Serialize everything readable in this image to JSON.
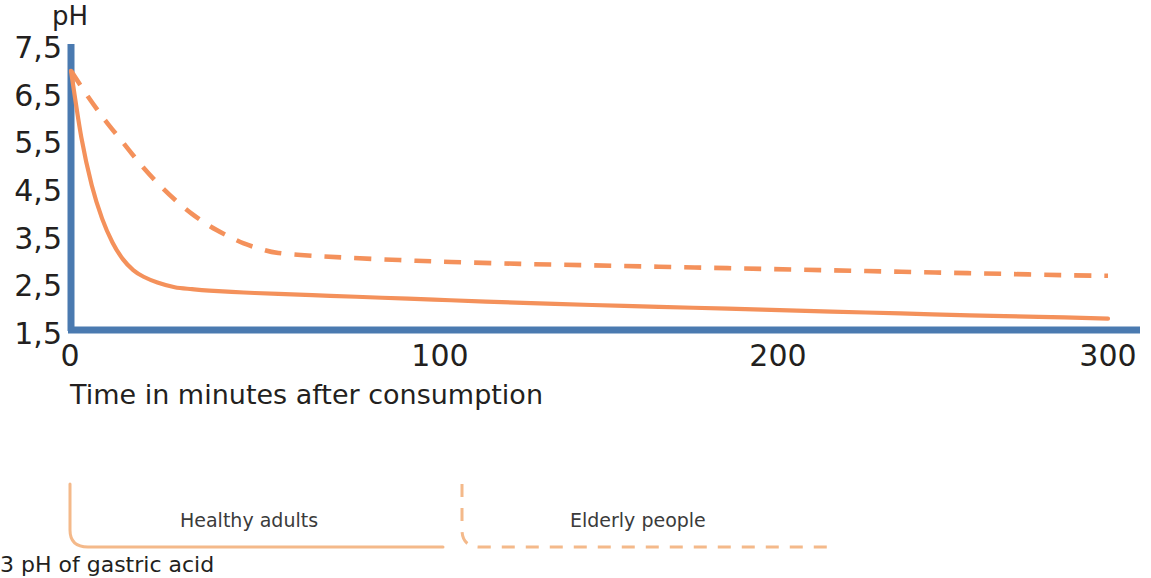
{
  "chart_data": {
    "type": "line",
    "title": "",
    "subtitle": "",
    "xlabel": "Time in minutes after consumption",
    "ylabel": "pH",
    "xlim": [
      0,
      300
    ],
    "ylim": [
      1.5,
      7.5
    ],
    "xticks": [
      0,
      100,
      200,
      300
    ],
    "xticklabels": [
      "0",
      "100",
      "200",
      "300"
    ],
    "yticks": [
      1.5,
      2.5,
      3.5,
      4.5,
      5.5,
      6.5,
      7.5
    ],
    "yticklabels": [
      "1,5",
      "2,5",
      "3,5",
      "4,5",
      "5,5",
      "6,5",
      "7,5"
    ],
    "grid": false,
    "legend_position": "below",
    "axis_color": "#4a7ab0",
    "series": [
      {
        "name": "Healthy adults",
        "style": "solid",
        "color": "#f4915b",
        "x": [
          0,
          3,
          6,
          9,
          12,
          15,
          18,
          21,
          25,
          30,
          35,
          40,
          50,
          60,
          75,
          90,
          105,
          120,
          140,
          160,
          180,
          200,
          220,
          240,
          260,
          280,
          300
        ],
        "y": [
          7.0,
          5.6,
          4.6,
          3.9,
          3.4,
          3.05,
          2.82,
          2.68,
          2.56,
          2.46,
          2.42,
          2.39,
          2.35,
          2.32,
          2.28,
          2.24,
          2.2,
          2.16,
          2.11,
          2.07,
          2.03,
          1.99,
          1.95,
          1.91,
          1.87,
          1.84,
          1.8
        ]
      },
      {
        "name": "Elderly people",
        "style": "dashed",
        "color": "#f4915b",
        "x": [
          0,
          5,
          10,
          15,
          20,
          25,
          30,
          35,
          40,
          45,
          50,
          55,
          60,
          70,
          80,
          95,
          110,
          130,
          150,
          170,
          190,
          210,
          230,
          250,
          270,
          290,
          300
        ],
        "y": [
          7.0,
          6.45,
          5.95,
          5.5,
          5.05,
          4.65,
          4.3,
          4.0,
          3.75,
          3.55,
          3.38,
          3.26,
          3.18,
          3.12,
          3.08,
          3.03,
          2.99,
          2.95,
          2.92,
          2.89,
          2.86,
          2.83,
          2.8,
          2.77,
          2.74,
          2.71,
          2.7
        ]
      }
    ]
  },
  "axes": {
    "y_title": "pH",
    "x_title": "Time in minutes after consumption",
    "y_ticks": [
      "7,5",
      "6,5",
      "5,5",
      "4,5",
      "3,5",
      "2,5",
      "1,5"
    ],
    "x_ticks": [
      "0",
      "100",
      "200",
      "300"
    ]
  },
  "legend": {
    "items": [
      {
        "label": "Healthy adults",
        "style": "solid",
        "color": "#f4915b"
      },
      {
        "label": "Elderly people",
        "style": "dashed",
        "color": "#f4b98a"
      }
    ]
  },
  "caption": {
    "text": "3 pH of gastric acid"
  },
  "colors": {
    "axis_blue": "#4a7ab0",
    "curve_orange": "#f4915b",
    "legend_orange": "#f4b98a",
    "text": "#231f20"
  }
}
